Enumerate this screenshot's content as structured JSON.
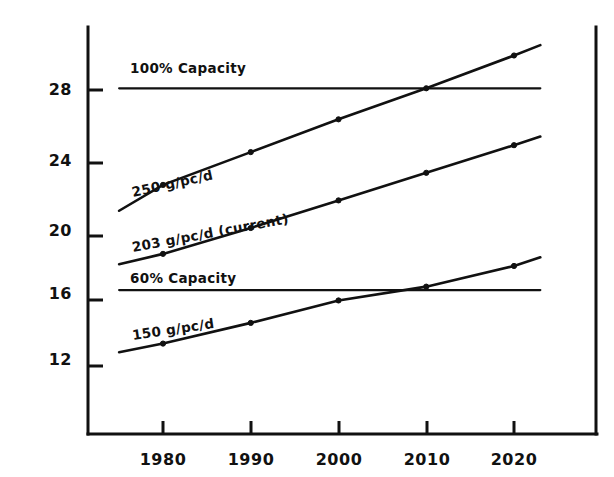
{
  "chart_data": {
    "type": "line",
    "title": "",
    "subtitle": "",
    "xlabel": "",
    "ylabel": "",
    "grid": false,
    "legend_position": "inline-labels",
    "xlim": [
      1975,
      2024
    ],
    "ylim": [
      10.4,
      30.2
    ],
    "x_ticks": [
      1980,
      1990,
      2000,
      2010,
      2020
    ],
    "x_tick_labels": [
      "1980",
      "1990",
      "2000",
      "2010",
      "2020"
    ],
    "y_ticks": [
      12,
      16,
      20,
      24,
      28
    ],
    "y_tick_labels": [
      "12",
      "16",
      "20",
      "24",
      "28"
    ],
    "annotations": [
      "100% Capacity",
      "250 g/pc/d",
      "203 g/pc/d  (current)",
      "60% Capacity",
      "150 g/pc/d"
    ],
    "series": [
      {
        "name": "100% Capacity",
        "label": "100% Capacity",
        "style": "horizontal-reference",
        "x": [
          1975,
          2023
        ],
        "values": [
          28.1,
          28.1
        ],
        "markers": false
      },
      {
        "name": "250 g/pc/d",
        "label": "250 g/pc/d",
        "style": "projection",
        "x": [
          1975,
          1980,
          1990,
          2000,
          2010,
          2020,
          2023
        ],
        "values": [
          21.0,
          22.5,
          24.4,
          26.3,
          28.1,
          30.0,
          30.6
        ],
        "markers": true,
        "marker_x": [
          1980,
          1990,
          2000,
          2010,
          2020
        ],
        "marker_values": [
          22.5,
          24.4,
          26.3,
          28.1,
          30.0
        ]
      },
      {
        "name": "203 g/pc/d (current)",
        "label": "203 g/pc/d  (current)",
        "style": "projection",
        "x": [
          1975,
          1980,
          1990,
          2000,
          2010,
          2020,
          2023
        ],
        "values": [
          17.9,
          18.5,
          20.0,
          21.6,
          23.2,
          24.8,
          25.3
        ],
        "markers": true,
        "marker_x": [
          1980,
          1990,
          2000,
          2010,
          2020
        ],
        "marker_values": [
          18.5,
          20.0,
          21.6,
          23.2,
          24.8
        ]
      },
      {
        "name": "60% Capacity",
        "label": "60% Capacity",
        "style": "horizontal-reference",
        "x": [
          1975,
          2023
        ],
        "values": [
          16.4,
          16.4
        ],
        "markers": false
      },
      {
        "name": "150 g/pc/d",
        "label": "150 g/pc/d",
        "style": "projection",
        "x": [
          1975,
          1980,
          1990,
          2000,
          2010,
          2020,
          2023
        ],
        "values": [
          12.8,
          13.3,
          14.5,
          15.8,
          16.6,
          17.8,
          18.3
        ],
        "markers": true,
        "marker_x": [
          1980,
          1990,
          2000,
          2010,
          2020
        ],
        "marker_values": [
          13.3,
          14.5,
          15.8,
          16.6,
          17.8
        ]
      }
    ]
  },
  "axis": {
    "y_tick_28": "28",
    "y_tick_24": "24",
    "y_tick_20": "20",
    "y_tick_16": "16",
    "y_tick_12": "12",
    "x_tick_1980": "1980",
    "x_tick_1990": "1990",
    "x_tick_2000": "2000",
    "x_tick_2010": "2010",
    "x_tick_2020": "2020"
  },
  "labels": {
    "capacity_100": "100% Capacity",
    "rate_250": "250 g/pc/d",
    "rate_203": "203 g/pc/d  (current)",
    "capacity_60": "60% Capacity",
    "rate_150": "150 g/pc/d"
  },
  "colors": {
    "ink": "#111111",
    "background": "#ffffff"
  }
}
